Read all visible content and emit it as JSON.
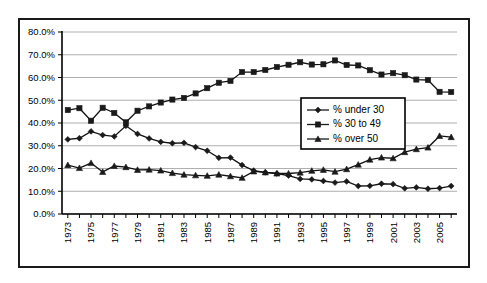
{
  "chart_data": {
    "type": "line",
    "title": "",
    "xlabel": "",
    "ylabel": "",
    "grid": true,
    "legend_position": "center-right",
    "ylim": [
      0,
      80
    ],
    "ytick_labels": [
      "0.0%",
      "10.0%",
      "20.0%",
      "30.0%",
      "40.0%",
      "50.0%",
      "60.0%",
      "70.0%",
      "80.0%"
    ],
    "ytick_values": [
      0,
      10,
      20,
      30,
      40,
      50,
      60,
      70,
      80
    ],
    "x": [
      1973,
      1974,
      1975,
      1976,
      1977,
      1978,
      1979,
      1980,
      1981,
      1982,
      1983,
      1984,
      1985,
      1986,
      1987,
      1988,
      1989,
      1990,
      1991,
      1992,
      1993,
      1994,
      1995,
      1996,
      1997,
      1998,
      1999,
      2000,
      2001,
      2002,
      2003,
      2004,
      2005,
      2006
    ],
    "xtick_labels": [
      "1973",
      "",
      "1975",
      "",
      "1977",
      "",
      "1979",
      "",
      "1981",
      "",
      "1983",
      "",
      "1985",
      "",
      "1987",
      "",
      "1989",
      "",
      "1991",
      "",
      "1993",
      "",
      "1995",
      "",
      "1997",
      "",
      "1999",
      "",
      "2001",
      "",
      "2003",
      "",
      "2005",
      ""
    ],
    "series": [
      {
        "name": "% under 30",
        "marker": "diamond",
        "color": "#1a1a1a",
        "values": [
          32.8,
          33.3,
          36.3,
          34.7,
          34.1,
          38.8,
          35.2,
          33.2,
          31.7,
          31.1,
          31.3,
          29.4,
          27.8,
          24.7,
          24.8,
          21.5,
          19.1,
          18.3,
          17.8,
          16.9,
          15.4,
          15.2,
          14.5,
          13.8,
          14.3,
          12.3,
          12.4,
          13.3,
          13.1,
          11.3,
          11.7,
          11.1,
          11.4,
          12.3
        ]
      },
      {
        "name": "% 30 to 49",
        "marker": "square",
        "color": "#1a1a1a",
        "values": [
          45.7,
          46.5,
          41.0,
          46.7,
          44.4,
          40.3,
          45.4,
          47.3,
          49.0,
          50.3,
          51.0,
          53.0,
          55.3,
          57.7,
          58.5,
          62.4,
          62.4,
          63.3,
          64.6,
          65.6,
          66.7,
          65.7,
          65.8,
          67.5,
          65.5,
          65.3,
          63.2,
          61.3,
          61.9,
          61.0,
          59.1,
          58.9,
          53.7,
          53.6
        ]
      },
      {
        "name": "% over 50",
        "marker": "triangle",
        "color": "#1a1a1a",
        "values": [
          21.5,
          20.2,
          22.4,
          18.5,
          21.1,
          20.6,
          19.4,
          19.5,
          19.1,
          18.0,
          17.3,
          17.0,
          16.8,
          17.3,
          16.6,
          15.9,
          18.7,
          18.3,
          17.8,
          17.8,
          18.2,
          19.0,
          19.4,
          18.6,
          19.7,
          21.7,
          23.9,
          24.8,
          24.5,
          27.2,
          28.5,
          29.2,
          34.3,
          33.8
        ]
      }
    ]
  }
}
